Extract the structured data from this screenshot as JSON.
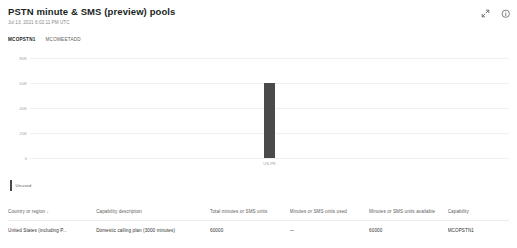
{
  "header": {
    "title": "PSTN minute & SMS (preview) pools",
    "timestamp": "Jul 13, 2021 6:02:11 PM UTC",
    "expand_icon": "expand-icon",
    "info_icon": "info-icon"
  },
  "tabs": [
    {
      "label": "MCOPSTN1",
      "active": true
    },
    {
      "label": "MCOMEETADD",
      "active": false
    }
  ],
  "legend": [
    {
      "label": "Unused",
      "color": "#4a4a4a"
    }
  ],
  "chart_data": {
    "type": "bar",
    "title": "",
    "xlabel": "",
    "ylabel": "",
    "categories": [
      "US-PR"
    ],
    "series": [
      {
        "name": "Unused",
        "color": "#4a4a4a",
        "values": [
          60000
        ]
      }
    ],
    "ylim": [
      0,
      80000
    ],
    "yticks": [
      0,
      20000,
      40000,
      60000,
      80000
    ],
    "ytick_labels": [
      "0",
      "20K",
      "40K",
      "60K",
      "80K"
    ],
    "grid": true,
    "legend_position": "bottom-left"
  },
  "table": {
    "columns": [
      {
        "label": "Country or region",
        "sort": "↓"
      },
      {
        "label": "Capability description",
        "sort": ""
      },
      {
        "label": "Total minutes or SMS units",
        "sort": ""
      },
      {
        "label": "Minutes or SMS units used",
        "sort": ""
      },
      {
        "label": "Minutes or SMS units available",
        "sort": ""
      },
      {
        "label": "Capability",
        "sort": ""
      }
    ],
    "rows": [
      {
        "country": "United States (including P...",
        "capability_description": "Domestic calling plan (3000 minutes)",
        "total": "60000",
        "used": "—",
        "available": "60000",
        "capability": "MCOPSTN1"
      }
    ]
  }
}
